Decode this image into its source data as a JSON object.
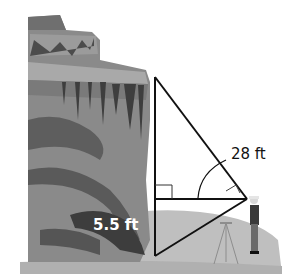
{
  "figure": {
    "labels": {
      "hypotenuse_length": "28 ft",
      "instrument_height": "5.5 ft"
    },
    "colors": {
      "background": "#ffffff",
      "cliff_light": "#9a9a9a",
      "cliff_mid": "#7d7d7d",
      "cliff_dark": "#4a4a4a",
      "ground": "#bdbdbd",
      "line": "#111111",
      "label_light": "#ffffff",
      "label_dark": "#111111"
    }
  }
}
